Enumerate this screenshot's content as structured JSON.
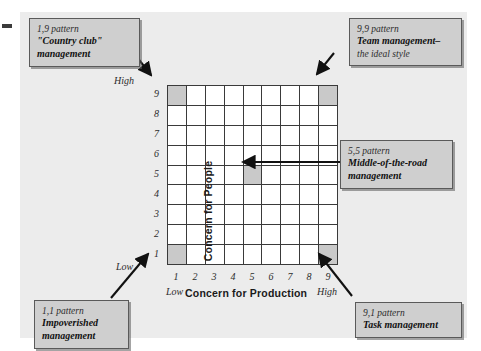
{
  "figure": {
    "type": "managerial-grid-diagram",
    "background_color": "#ececec",
    "shade_color": "#c9c9c9"
  },
  "axes": {
    "x": {
      "title": "Concern for Production",
      "ticks": [
        "1",
        "2",
        "3",
        "4",
        "5",
        "6",
        "7",
        "8",
        "9"
      ],
      "low_label": "Low",
      "high_label": "High"
    },
    "y": {
      "title": "Concern for People",
      "ticks": [
        "9",
        "8",
        "7",
        "6",
        "5",
        "4",
        "3",
        "2",
        "1"
      ],
      "low_label": "Low",
      "high_label": "High"
    }
  },
  "grid": {
    "columns": 9,
    "rows": 9,
    "shaded_cells": [
      {
        "x": 1,
        "y": 9,
        "pattern": "1,9"
      },
      {
        "x": 9,
        "y": 9,
        "pattern": "9,9"
      },
      {
        "x": 5,
        "y": 5,
        "pattern": "5,5"
      },
      {
        "x": 1,
        "y": 1,
        "pattern": "1,1"
      },
      {
        "x": 9,
        "y": 1,
        "pattern": "9,1"
      }
    ]
  },
  "callouts": [
    {
      "id": "country-club",
      "pattern": "1,9 pattern",
      "lines": [
        "\"Country club\"",
        "management"
      ]
    },
    {
      "id": "team-management",
      "pattern": "9,9 pattern",
      "lines": [
        "Team management–",
        "the ideal style"
      ],
      "bold_lines": 1
    },
    {
      "id": "middle-of-the-road",
      "pattern": "5,5 pattern",
      "lines": [
        "Middle-of-the-road",
        "management"
      ]
    },
    {
      "id": "impoverished",
      "pattern": "1,1 pattern",
      "lines": [
        "Impoverished",
        "management"
      ]
    },
    {
      "id": "task-management",
      "pattern": "9,1 pattern",
      "lines": [
        "Task management"
      ]
    }
  ]
}
